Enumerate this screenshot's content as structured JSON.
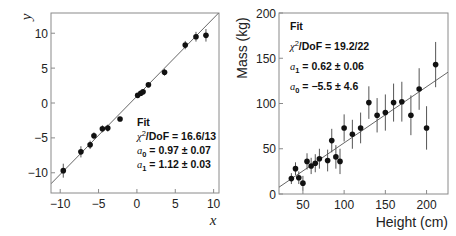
{
  "chart_data": [
    {
      "type": "scatter",
      "title": "",
      "xlabel": "x",
      "ylabel": "y",
      "xlim": [
        -11.2,
        10.7
      ],
      "ylim": [
        -12.9,
        12.9
      ],
      "xticks": [
        -10,
        -5,
        0,
        5,
        10
      ],
      "yticks": [
        -10,
        -5,
        0,
        5,
        10
      ],
      "xtick_labels": [
        "−10",
        "−5",
        "0",
        "5",
        "10"
      ],
      "ytick_labels": [
        "−10",
        "−5",
        "0",
        "5",
        "10"
      ],
      "grid": false,
      "series": [
        {
          "name": "data",
          "x": [
            -9.6,
            -7.3,
            -6.1,
            -5.6,
            -4.5,
            -3.8,
            -2.2,
            0.1,
            0.5,
            0.8,
            1.5,
            3.6,
            6.3,
            7.7,
            9.0
          ],
          "y": [
            -9.7,
            -7.0,
            -6.0,
            -4.7,
            -3.7,
            -3.6,
            -2.3,
            1.1,
            1.4,
            1.6,
            2.6,
            4.4,
            8.3,
            9.5,
            9.7
          ],
          "yerr": [
            1.0,
            0.8,
            0.6,
            0.5,
            0.5,
            0.5,
            0.3,
            0.2,
            0.2,
            0.2,
            0.2,
            0.5,
            0.6,
            0.7,
            0.9
          ]
        },
        {
          "name": "Fit",
          "type": "line",
          "intercept": 0.97,
          "slope": 1.12
        }
      ],
      "legend": {
        "title": "Fit",
        "lines": [
          {
            "lhs": "χ",
            "sup": "2",
            "rest": "/DoF = 16.6/13"
          },
          {
            "lhs": "a",
            "sub": "0",
            "rest": " = 0.97 ± 0.07"
          },
          {
            "lhs": "a",
            "sub": "1",
            "rest": " = 1.12 ± 0.03"
          }
        ],
        "position": "lower right"
      }
    },
    {
      "type": "scatter",
      "title": "",
      "xlabel": "Height (cm)",
      "ylabel": "Mass (kg)",
      "xlim": [
        21,
        226
      ],
      "ylim": [
        0,
        200
      ],
      "xticks": [
        50,
        100,
        150,
        200
      ],
      "yticks": [
        0,
        50,
        100,
        150,
        200
      ],
      "xtick_labels": [
        "50",
        "100",
        "150",
        "200"
      ],
      "ytick_labels": [
        "0",
        "50",
        "100",
        "150",
        "200"
      ],
      "grid": false,
      "series": [
        {
          "name": "data",
          "x": [
            36,
            41,
            45,
            50,
            55,
            60,
            65,
            70,
            80,
            85,
            90,
            95,
            100,
            110,
            120,
            130,
            140,
            150,
            160,
            170,
            181,
            191,
            200,
            211
          ],
          "y": [
            17,
            28,
            18,
            12,
            36,
            31,
            34,
            39,
            37,
            59,
            41,
            36,
            73,
            66,
            73,
            101,
            87,
            90,
            101,
            102,
            87,
            116,
            73,
            143
          ],
          "yerr": [
            6,
            7,
            7,
            8,
            9,
            9,
            10,
            11,
            12,
            13,
            13,
            14,
            15,
            16,
            17,
            18,
            19,
            20,
            21,
            22,
            22,
            23,
            24,
            25
          ]
        },
        {
          "name": "Fit",
          "type": "line",
          "intercept": -5.5,
          "slope": 0.62
        }
      ],
      "legend": {
        "title": "Fit",
        "lines": [
          {
            "lhs": "χ",
            "sup": "2",
            "rest": "/DoF = 19.2/22"
          },
          {
            "lhs": "a",
            "sub": "1",
            "rest": " = 0.62 ± 0.06"
          },
          {
            "lhs": "a",
            "sub": "0",
            "rest": " = −5.5 ± 4.6"
          }
        ],
        "position": "upper left"
      }
    }
  ],
  "colors": {
    "frame": "#8a8a8a",
    "marker": "#111111",
    "errorbar": "#555555",
    "fitline": "#666666",
    "text": "#222222"
  }
}
